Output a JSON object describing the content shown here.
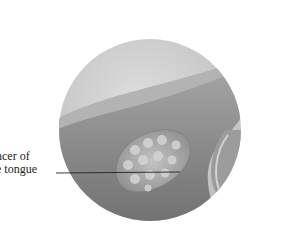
{
  "figure": {
    "label_lines": [
      "ncer of",
      "e tongue"
    ],
    "full_label": "Cancer of the tongue",
    "colors": {
      "background": "#ffffff",
      "circle": "#c9c9c9",
      "tongue": "#8e8e8e",
      "tongue_highlight": "#b5b5b5",
      "tumor": "#a9a9a9",
      "leader_line": "#222222"
    }
  }
}
